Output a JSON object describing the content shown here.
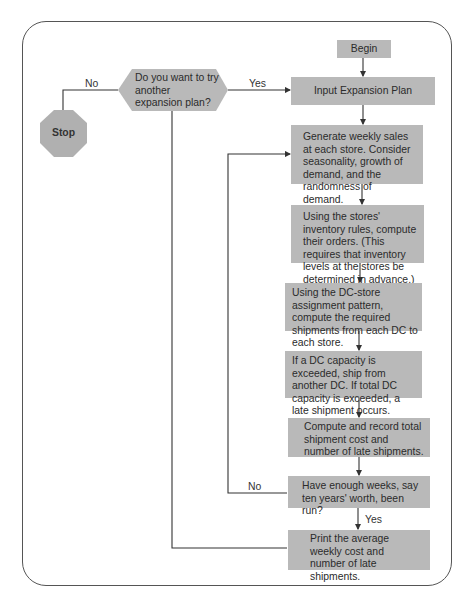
{
  "flowchart": {
    "nodes": {
      "begin": "Begin",
      "input_plan": "Input Expansion Plan",
      "generate_sales": "Generate weekly sales at each store.  Consider seasonality, growth of demand, and the randomness of demand.",
      "compute_orders": "Using the stores' inventory rules, compute their orders. (This requires that inventory levels at the stores be determined in advance.)",
      "compute_shipments": "Using the DC-store assignment pattern, compute the required shipments from each DC to each store.",
      "capacity_check": "If a DC capacity is exceeded, ship from another DC.  If total DC capacity is exceeded, a late shipment occurs.",
      "record_cost": "Compute and record total shipment cost and number of late shipments.",
      "enough_weeks": "Have enough weeks, say ten years' worth, been run?",
      "print_results": "Print the average weekly cost and number of late shipments.",
      "try_another": "Do you want to try another expansion plan?",
      "stop": "Stop"
    },
    "edge_labels": {
      "try_another_yes": "Yes",
      "try_another_no": "No",
      "enough_weeks_yes": "Yes",
      "enough_weeks_no": "No"
    },
    "colors": {
      "box_fill": "#b9b9b9",
      "line": "#333333",
      "frame": "#555555"
    }
  }
}
